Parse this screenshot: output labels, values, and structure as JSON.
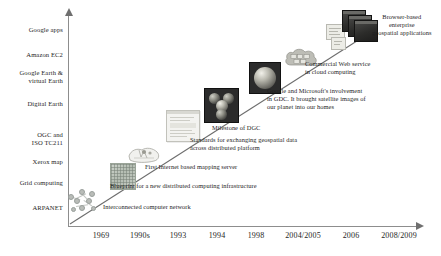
{
  "figure": {
    "axis_color": "#8d8d8d",
    "text_color": "#1e1e1e"
  },
  "y_axis": {
    "labels": [
      {
        "text": "Google apps",
        "top": 26
      },
      {
        "text": "Amazon EC2",
        "top": 51
      },
      {
        "text": "Google Earth &\nvirtual Earth",
        "top": 69
      },
      {
        "text": "Digital Earth",
        "top": 100
      },
      {
        "text": "OGC and\nISO TC211",
        "top": 131
      },
      {
        "text": "Xerox map",
        "top": 158
      },
      {
        "text": "Grid computing",
        "top": 179
      },
      {
        "text": "ARPANET",
        "top": 204
      }
    ]
  },
  "x_axis": {
    "labels": [
      {
        "text": "1969",
        "left": 101
      },
      {
        "text": "1990s",
        "left": 140
      },
      {
        "text": "1993",
        "left": 178
      },
      {
        "text": "1994",
        "left": 217
      },
      {
        "text": "1998",
        "left": 256
      },
      {
        "text": "2004/2005",
        "left": 303
      },
      {
        "text": "2006",
        "left": 351
      },
      {
        "text": "2008/2009",
        "left": 399
      }
    ]
  },
  "annotations": [
    {
      "name": "annotation-interconnected-network",
      "text": "Interconnected computer network",
      "left": 103,
      "top": 203
    },
    {
      "name": "annotation-blueprint-distributed",
      "text": "Blueprint for a new distributed computing infrastructure",
      "left": 110,
      "top": 182
    },
    {
      "name": "annotation-first-mapping-server",
      "text": "First Internet based mapping server",
      "left": 145,
      "top": 163
    },
    {
      "name": "annotation-standards-geospatial",
      "text": "Standards for exchanging geospatial data\nacross distributed platform",
      "left": 190,
      "top": 136
    },
    {
      "name": "annotation-milestone-dgc",
      "text": "Milestone of DGC",
      "left": 212,
      "top": 124
    },
    {
      "name": "annotation-google-microsoft",
      "text": "Google and Microsoft's involvement\nin GDC. It brought satellite images of\nour planet into our homes",
      "left": 267,
      "top": 87
    },
    {
      "name": "annotation-commercial-web-service",
      "text": "Commercial Web service\nin cloud computing",
      "left": 305,
      "top": 60
    },
    {
      "name": "annotation-browser-based",
      "text": "Browser-based\nenterprise\ngeospatial applications",
      "left": 372,
      "top": 13
    }
  ],
  "thumbnails": [
    {
      "name": "arpanet-node-graph",
      "label": "ARPANET node network diagram"
    },
    {
      "name": "grid-map-thumbnail",
      "label": "Grid computing map tile"
    },
    {
      "name": "xerox-map-thumbnail",
      "label": "Xerox map sketch"
    },
    {
      "name": "ogc-document-window",
      "label": "OGC standards document window"
    },
    {
      "name": "digital-earth-globes",
      "label": "Digital Earth four globes"
    },
    {
      "name": "google-earth-globe",
      "label": "Google Earth single globe"
    },
    {
      "name": "cloud-servers",
      "label": "Cloud computing servers"
    },
    {
      "name": "browser-stack",
      "label": "Stacked browser windows"
    }
  ]
}
